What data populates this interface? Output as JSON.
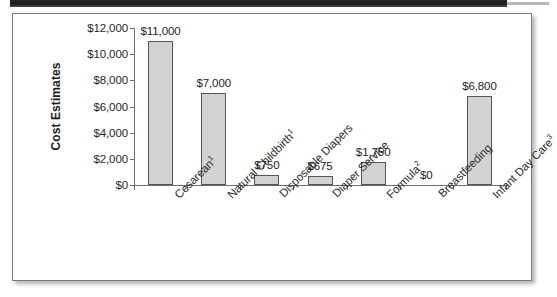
{
  "page": {
    "background_color": "#ffffff",
    "scan_band_color": "#1c1c1c"
  },
  "frame": {
    "border_color": "#7b7b7b",
    "background_color": "#ffffff"
  },
  "chart_data": {
    "type": "bar",
    "title": "",
    "xlabel": "",
    "ylabel": "Cost Estimates",
    "ylim": [
      0,
      12000
    ],
    "grid": false,
    "legend": null,
    "bar_fill_color": "#d2d2d2",
    "bar_border_color": "#555555",
    "axis_color": "#6e6e6e",
    "ytick_labels": [
      "$0",
      "$2,000",
      "$4,000",
      "$6,000",
      "$8,000",
      "$10,000",
      "$12,000"
    ],
    "ytick_values": [
      0,
      2000,
      4000,
      6000,
      8000,
      10000,
      12000
    ],
    "categories": [
      "Cesarean",
      "Natural Childbirth",
      "Disposable Diapers",
      "Diaper Service",
      "Formula",
      "Breastfeeding",
      "Infant Day Care"
    ],
    "category_footnotes": [
      "1",
      "1",
      "",
      "",
      "2",
      "",
      "3"
    ],
    "values": [
      11000,
      7000,
      750,
      675,
      1750,
      0,
      6800
    ],
    "data_labels": [
      "$11,000",
      "$7,000",
      "$750",
      "$675",
      "$1,750",
      "$0",
      "$6,800"
    ]
  }
}
